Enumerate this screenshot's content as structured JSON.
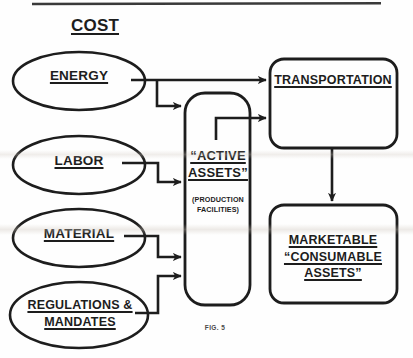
{
  "figure": {
    "caption": "FIG. 5",
    "title": "COST",
    "stroke_color": "#1d1d1d",
    "text_color": "#1d1d1d",
    "background_color": "#fefefe",
    "top_rule": true
  },
  "inputs": [
    {
      "id": "energy",
      "label": "ENERGY",
      "shape": "ellipse",
      "underlined": true
    },
    {
      "id": "labor",
      "label": "LABOR",
      "shape": "ellipse",
      "underlined": true
    },
    {
      "id": "material",
      "label": "MATERIAL",
      "shape": "ellipse",
      "underlined": true
    },
    {
      "id": "regulations",
      "label_line1": "REGULATIONS &",
      "label_line2": "MANDATES",
      "shape": "ellipse",
      "underlined": true
    }
  ],
  "process": {
    "id": "active-assets",
    "label_line1": "“ACTIVE",
    "label_line2": "ASSETS”",
    "sub_line1": "(PRODUCTION",
    "sub_line2": "FACILITIES)",
    "shape": "rounded-rect",
    "underlined": true
  },
  "outputs": [
    {
      "id": "transportation",
      "label": "TRANSPORTATION",
      "shape": "rounded-rect",
      "underlined": true
    },
    {
      "id": "marketable-consumable-assets",
      "label_line1": "MARKETABLE",
      "label_line2": "“CONSUMABLE",
      "label_line3": "ASSETS”",
      "shape": "rounded-rect",
      "underlined": true
    }
  ],
  "connections": [
    {
      "from": "energy",
      "to": "transportation",
      "style": "straight-arrow"
    },
    {
      "from": "energy",
      "to": "active-assets",
      "style": "branch-down-right-arrow"
    },
    {
      "from": "labor",
      "to": "active-assets",
      "style": "right-down-right-arrow"
    },
    {
      "from": "material",
      "to": "active-assets",
      "style": "right-down-right-arrow"
    },
    {
      "from": "regulations",
      "to": "active-assets",
      "style": "right-up-right-arrow"
    },
    {
      "from": "active-assets",
      "to": "transportation",
      "style": "up-right-arrow"
    },
    {
      "from": "transportation",
      "to": "marketable-consumable-assets",
      "style": "down-arrow"
    }
  ]
}
